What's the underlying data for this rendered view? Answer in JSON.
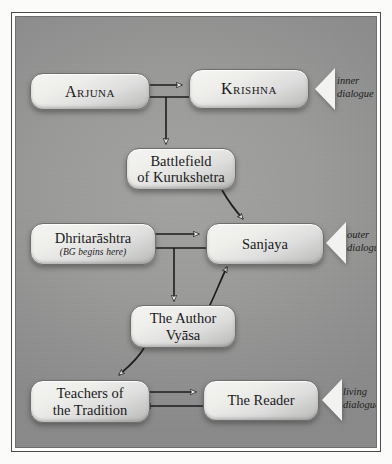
{
  "diagram": {
    "nodes": [
      {
        "id": "arjuna",
        "label": "Arjuna",
        "style": "small-caps"
      },
      {
        "id": "krishna",
        "label": "Krishna",
        "style": "small-caps"
      },
      {
        "id": "battlefield",
        "label": "Battlefield\nof Kurukshetra",
        "style": "plain"
      },
      {
        "id": "dhritarashtra",
        "label": "Dhritarāshtra",
        "style": "plain",
        "subtitle": "(BG begins here)"
      },
      {
        "id": "sanjaya",
        "label": "Sanjaya",
        "style": "plain"
      },
      {
        "id": "vyasa",
        "label": "The Author\nVyāsa",
        "style": "plain"
      },
      {
        "id": "teachers",
        "label": "Teachers of\nthe Tradition",
        "style": "plain"
      },
      {
        "id": "reader",
        "label": "The Reader",
        "style": "plain"
      }
    ],
    "brackets": [
      {
        "id": "inner",
        "label": "inner\ndialogue"
      },
      {
        "id": "outer",
        "label": "outer\ndialogue"
      },
      {
        "id": "living",
        "label": "living\ndialogue"
      }
    ],
    "edges": [
      {
        "from": "arjuna",
        "to": "krishna",
        "kind": "straight-arrow"
      },
      {
        "from": "krishna",
        "to": "arjuna",
        "kind": "straight-arrow"
      },
      {
        "from": "krishna-arjuna-midpoint",
        "to": "battlefield",
        "kind": "vertical-arrow"
      },
      {
        "from": "battlefield",
        "to": "sanjaya",
        "kind": "curved-arrow"
      },
      {
        "from": "dhritarashtra",
        "to": "sanjaya",
        "kind": "straight-arrow"
      },
      {
        "from": "sanjaya",
        "to": "dhritarashtra",
        "kind": "straight-arrow"
      },
      {
        "from": "sanjaya-dhritarashtra-midpoint",
        "to": "vyasa",
        "kind": "vertical-arrow"
      },
      {
        "from": "vyasa",
        "to": "sanjaya",
        "kind": "curved-arrow"
      },
      {
        "from": "vyasa",
        "to": "teachers",
        "kind": "curved-arrow"
      },
      {
        "from": "teachers",
        "to": "reader",
        "kind": "straight-arrow"
      },
      {
        "from": "reader",
        "to": "teachers",
        "kind": "straight-arrow"
      }
    ],
    "colors": {
      "page_background": "#fbfbfa",
      "canvas_background": "#9a9a98",
      "node_fill": "#eeeeeb",
      "node_border": "#6e6e6c",
      "text": "#1a1a1a",
      "bracket_fill": "#f2f2f0",
      "arrow": "#1d1d1d"
    }
  }
}
